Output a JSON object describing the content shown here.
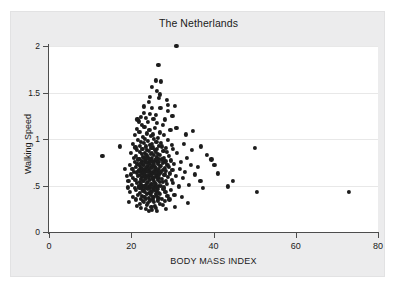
{
  "chart_data": {
    "type": "scatter",
    "title": "The Netherlands",
    "xlabel": "BODY MASS INDEX",
    "ylabel": "Walking Speed",
    "xlim": [
      0,
      80
    ],
    "ylim": [
      0,
      2
    ],
    "grid": "horizontal",
    "legend": "none",
    "marker": {
      "shape": "circle",
      "color": "#1c1c1c",
      "size": 4.2
    },
    "xticks": [
      0,
      20,
      40,
      60,
      80
    ],
    "xtick_labels": [
      "0",
      "20",
      "40",
      "60",
      "80"
    ],
    "yticks": [
      0,
      0.5,
      1,
      1.5,
      2
    ],
    "ytick_labels": [
      "0",
      ".5",
      "1",
      "1.5",
      "2"
    ],
    "points": [
      [
        31.0,
        2.0
      ],
      [
        26.6,
        1.8
      ],
      [
        26.0,
        1.63
      ],
      [
        27.3,
        1.62
      ],
      [
        26.3,
        1.52
      ],
      [
        26.8,
        1.44
      ],
      [
        28.6,
        1.42
      ],
      [
        24.2,
        1.4
      ],
      [
        29.0,
        1.37
      ],
      [
        30.6,
        1.36
      ],
      [
        25.0,
        1.33
      ],
      [
        27.1,
        1.33
      ],
      [
        23.1,
        1.28
      ],
      [
        24.6,
        1.27
      ],
      [
        26.0,
        1.26
      ],
      [
        22.3,
        1.24
      ],
      [
        23.6,
        1.23
      ],
      [
        25.4,
        1.22
      ],
      [
        28.2,
        1.21
      ],
      [
        21.8,
        1.19
      ],
      [
        24.0,
        1.18
      ],
      [
        26.2,
        1.17
      ],
      [
        22.6,
        1.15
      ],
      [
        27.6,
        1.15
      ],
      [
        23.2,
        1.13
      ],
      [
        25.8,
        1.12
      ],
      [
        21.3,
        1.11
      ],
      [
        24.4,
        1.1
      ],
      [
        29.5,
        1.1
      ],
      [
        22.0,
        1.08
      ],
      [
        26.9,
        1.07
      ],
      [
        23.8,
        1.06
      ],
      [
        25.2,
        1.05
      ],
      [
        20.8,
        1.04
      ],
      [
        27.9,
        1.04
      ],
      [
        24.8,
        1.03
      ],
      [
        22.8,
        1.02
      ],
      [
        26.4,
        1.01
      ],
      [
        23.4,
        1.0
      ],
      [
        25.6,
        1.0
      ],
      [
        21.6,
        0.99
      ],
      [
        28.9,
        0.99
      ],
      [
        24.1,
        0.98
      ],
      [
        26.1,
        0.97
      ],
      [
        22.4,
        0.97
      ],
      [
        27.2,
        0.96
      ],
      [
        23.0,
        0.96
      ],
      [
        25.0,
        0.95
      ],
      [
        20.4,
        0.95
      ],
      [
        29.8,
        0.94
      ],
      [
        24.5,
        0.94
      ],
      [
        26.7,
        0.93
      ],
      [
        22.1,
        0.93
      ],
      [
        27.5,
        0.92
      ],
      [
        23.5,
        0.92
      ],
      [
        25.3,
        0.91
      ],
      [
        21.0,
        0.91
      ],
      [
        28.4,
        0.9
      ],
      [
        24.9,
        0.9
      ],
      [
        26.3,
        0.89
      ],
      [
        22.7,
        0.89
      ],
      [
        30.1,
        0.89
      ],
      [
        23.9,
        0.88
      ],
      [
        25.7,
        0.88
      ],
      [
        21.4,
        0.88
      ],
      [
        27.8,
        0.87
      ],
      [
        24.3,
        0.87
      ],
      [
        26.0,
        0.86
      ],
      [
        22.2,
        0.86
      ],
      [
        28.7,
        0.86
      ],
      [
        23.3,
        0.85
      ],
      [
        25.1,
        0.85
      ],
      [
        20.0,
        0.85
      ],
      [
        31.2,
        0.85
      ],
      [
        24.7,
        0.84
      ],
      [
        26.5,
        0.84
      ],
      [
        22.5,
        0.84
      ],
      [
        27.0,
        0.83
      ],
      [
        23.7,
        0.83
      ],
      [
        25.5,
        0.83
      ],
      [
        21.2,
        0.82
      ],
      [
        13.0,
        0.82
      ],
      [
        29.2,
        0.82
      ],
      [
        24.0,
        0.81
      ],
      [
        26.2,
        0.81
      ],
      [
        22.9,
        0.81
      ],
      [
        28.0,
        0.8
      ],
      [
        23.2,
        0.8
      ],
      [
        25.0,
        0.8
      ],
      [
        20.6,
        0.8
      ],
      [
        33.5,
        0.8
      ],
      [
        24.4,
        0.79
      ],
      [
        26.8,
        0.79
      ],
      [
        22.0,
        0.79
      ],
      [
        27.4,
        0.78
      ],
      [
        23.6,
        0.78
      ],
      [
        25.9,
        0.78
      ],
      [
        21.7,
        0.78
      ],
      [
        29.6,
        0.77
      ],
      [
        24.8,
        0.77
      ],
      [
        26.1,
        0.77
      ],
      [
        22.6,
        0.76
      ],
      [
        28.3,
        0.76
      ],
      [
        23.4,
        0.76
      ],
      [
        25.2,
        0.76
      ],
      [
        20.9,
        0.75
      ],
      [
        32.0,
        0.75
      ],
      [
        24.2,
        0.75
      ],
      [
        26.6,
        0.75
      ],
      [
        22.3,
        0.74
      ],
      [
        27.7,
        0.74
      ],
      [
        23.8,
        0.74
      ],
      [
        25.6,
        0.74
      ],
      [
        21.5,
        0.73
      ],
      [
        30.4,
        0.73
      ],
      [
        24.6,
        0.73
      ],
      [
        26.4,
        0.73
      ],
      [
        22.8,
        0.72
      ],
      [
        28.8,
        0.72
      ],
      [
        23.1,
        0.72
      ],
      [
        25.4,
        0.72
      ],
      [
        19.6,
        0.72
      ],
      [
        34.5,
        0.72
      ],
      [
        24.0,
        0.71
      ],
      [
        26.9,
        0.71
      ],
      [
        22.1,
        0.71
      ],
      [
        27.2,
        0.71
      ],
      [
        23.9,
        0.7
      ],
      [
        25.8,
        0.7
      ],
      [
        21.1,
        0.7
      ],
      [
        29.1,
        0.7
      ],
      [
        24.9,
        0.7
      ],
      [
        26.0,
        0.69
      ],
      [
        22.4,
        0.69
      ],
      [
        28.1,
        0.69
      ],
      [
        23.5,
        0.69
      ],
      [
        25.1,
        0.69
      ],
      [
        20.3,
        0.68
      ],
      [
        31.8,
        0.68
      ],
      [
        24.3,
        0.68
      ],
      [
        26.7,
        0.68
      ],
      [
        22.7,
        0.68
      ],
      [
        27.6,
        0.67
      ],
      [
        23.3,
        0.67
      ],
      [
        25.7,
        0.67
      ],
      [
        21.9,
        0.67
      ],
      [
        30.0,
        0.67
      ],
      [
        24.5,
        0.66
      ],
      [
        26.3,
        0.66
      ],
      [
        22.0,
        0.66
      ],
      [
        28.5,
        0.66
      ],
      [
        23.7,
        0.66
      ],
      [
        25.3,
        0.65
      ],
      [
        20.7,
        0.65
      ],
      [
        33.0,
        0.65
      ],
      [
        24.1,
        0.65
      ],
      [
        26.5,
        0.65
      ],
      [
        22.5,
        0.64
      ],
      [
        27.1,
        0.64
      ],
      [
        23.0,
        0.64
      ],
      [
        25.5,
        0.64
      ],
      [
        21.3,
        0.64
      ],
      [
        29.4,
        0.63
      ],
      [
        24.7,
        0.63
      ],
      [
        26.1,
        0.63
      ],
      [
        22.9,
        0.63
      ],
      [
        28.2,
        0.62
      ],
      [
        23.4,
        0.62
      ],
      [
        25.0,
        0.62
      ],
      [
        19.9,
        0.62
      ],
      [
        35.5,
        0.62
      ],
      [
        24.4,
        0.61
      ],
      [
        26.8,
        0.61
      ],
      [
        22.2,
        0.61
      ],
      [
        27.9,
        0.61
      ],
      [
        23.8,
        0.6
      ],
      [
        25.9,
        0.6
      ],
      [
        21.6,
        0.6
      ],
      [
        30.8,
        0.6
      ],
      [
        24.8,
        0.6
      ],
      [
        26.2,
        0.59
      ],
      [
        22.6,
        0.59
      ],
      [
        28.9,
        0.59
      ],
      [
        23.2,
        0.59
      ],
      [
        25.4,
        0.58
      ],
      [
        20.5,
        0.58
      ],
      [
        32.6,
        0.58
      ],
      [
        24.2,
        0.58
      ],
      [
        26.6,
        0.58
      ],
      [
        22.3,
        0.57
      ],
      [
        27.4,
        0.57
      ],
      [
        23.6,
        0.57
      ],
      [
        25.2,
        0.57
      ],
      [
        21.0,
        0.56
      ],
      [
        29.9,
        0.56
      ],
      [
        24.6,
        0.56
      ],
      [
        26.4,
        0.56
      ],
      [
        22.8,
        0.55
      ],
      [
        28.4,
        0.55
      ],
      [
        23.1,
        0.55
      ],
      [
        25.6,
        0.55
      ],
      [
        19.3,
        0.55
      ],
      [
        36.8,
        0.55
      ],
      [
        24.0,
        0.54
      ],
      [
        26.9,
        0.54
      ],
      [
        22.1,
        0.54
      ],
      [
        27.7,
        0.54
      ],
      [
        23.9,
        0.53
      ],
      [
        25.8,
        0.53
      ],
      [
        21.4,
        0.53
      ],
      [
        30.2,
        0.53
      ],
      [
        24.9,
        0.52
      ],
      [
        26.0,
        0.52
      ],
      [
        22.4,
        0.52
      ],
      [
        28.6,
        0.52
      ],
      [
        23.5,
        0.51
      ],
      [
        25.1,
        0.51
      ],
      [
        20.1,
        0.51
      ],
      [
        34.0,
        0.51
      ],
      [
        24.3,
        0.5
      ],
      [
        26.7,
        0.5
      ],
      [
        22.7,
        0.5
      ],
      [
        27.3,
        0.5
      ],
      [
        23.3,
        0.49
      ],
      [
        25.7,
        0.49
      ],
      [
        21.8,
        0.49
      ],
      [
        31.5,
        0.49
      ],
      [
        24.5,
        0.48
      ],
      [
        26.3,
        0.48
      ],
      [
        22.0,
        0.48
      ],
      [
        28.0,
        0.48
      ],
      [
        23.7,
        0.47
      ],
      [
        25.3,
        0.47
      ],
      [
        20.8,
        0.47
      ],
      [
        37.5,
        0.47
      ],
      [
        24.1,
        0.46
      ],
      [
        26.5,
        0.46
      ],
      [
        22.5,
        0.46
      ],
      [
        27.8,
        0.46
      ],
      [
        23.0,
        0.45
      ],
      [
        25.5,
        0.45
      ],
      [
        21.2,
        0.45
      ],
      [
        29.7,
        0.45
      ],
      [
        24.7,
        0.44
      ],
      [
        26.1,
        0.44
      ],
      [
        22.9,
        0.44
      ],
      [
        28.3,
        0.43
      ],
      [
        23.4,
        0.43
      ],
      [
        25.0,
        0.43
      ],
      [
        19.7,
        0.43
      ],
      [
        50.5,
        0.43
      ],
      [
        73.0,
        0.43
      ],
      [
        24.4,
        0.42
      ],
      [
        26.8,
        0.42
      ],
      [
        22.2,
        0.42
      ],
      [
        27.0,
        0.41
      ],
      [
        23.8,
        0.41
      ],
      [
        25.9,
        0.41
      ],
      [
        21.6,
        0.4
      ],
      [
        30.5,
        0.4
      ],
      [
        24.8,
        0.4
      ],
      [
        26.2,
        0.39
      ],
      [
        22.6,
        0.39
      ],
      [
        28.8,
        0.39
      ],
      [
        23.2,
        0.38
      ],
      [
        25.4,
        0.38
      ],
      [
        20.4,
        0.38
      ],
      [
        32.3,
        0.38
      ],
      [
        24.2,
        0.37
      ],
      [
        26.6,
        0.37
      ],
      [
        22.3,
        0.36
      ],
      [
        27.5,
        0.36
      ],
      [
        23.6,
        0.36
      ],
      [
        25.2,
        0.35
      ],
      [
        21.1,
        0.35
      ],
      [
        29.3,
        0.35
      ],
      [
        24.6,
        0.34
      ],
      [
        26.4,
        0.34
      ],
      [
        22.8,
        0.33
      ],
      [
        28.1,
        0.33
      ],
      [
        23.1,
        0.32
      ],
      [
        25.6,
        0.32
      ],
      [
        19.5,
        0.32
      ],
      [
        33.8,
        0.31
      ],
      [
        24.0,
        0.31
      ],
      [
        26.9,
        0.3
      ],
      [
        22.1,
        0.3
      ],
      [
        27.6,
        0.29
      ],
      [
        23.9,
        0.29
      ],
      [
        25.8,
        0.28
      ],
      [
        21.3,
        0.28
      ],
      [
        30.7,
        0.27
      ],
      [
        24.9,
        0.27
      ],
      [
        26.0,
        0.26
      ],
      [
        22.4,
        0.26
      ],
      [
        28.5,
        0.25
      ],
      [
        23.5,
        0.25
      ],
      [
        25.1,
        0.24
      ],
      [
        26.3,
        0.23
      ],
      [
        24.3,
        0.23
      ],
      [
        17.2,
        0.92
      ],
      [
        18.4,
        0.68
      ],
      [
        18.9,
        0.6
      ],
      [
        19.1,
        0.48
      ],
      [
        35.0,
        1.09
      ],
      [
        33.2,
        1.05
      ],
      [
        37.0,
        0.92
      ],
      [
        39.5,
        0.78
      ],
      [
        41.0,
        0.63
      ],
      [
        43.5,
        0.49
      ],
      [
        44.8,
        0.55
      ],
      [
        50.0,
        0.9
      ],
      [
        40.2,
        0.72
      ],
      [
        38.3,
        0.83
      ],
      [
        36.2,
        0.7
      ],
      [
        34.8,
        0.88
      ],
      [
        32.8,
        0.95
      ],
      [
        31.0,
        1.12
      ],
      [
        30.0,
        1.25
      ],
      [
        29.0,
        1.3
      ],
      [
        27.0,
        1.48
      ],
      [
        25.0,
        1.56
      ],
      [
        24.5,
        1.45
      ],
      [
        23.0,
        1.35
      ],
      [
        21.5,
        1.21
      ]
    ]
  }
}
